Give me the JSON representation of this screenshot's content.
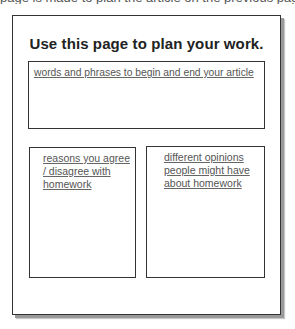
{
  "page": {
    "cutoff_text": "page is made to plan the article on the previous page",
    "title": "Use this page to plan your work."
  },
  "boxes": {
    "top": {
      "label": "words and phrases to begin and end your article"
    },
    "left": {
      "label": "reasons you agree / disagree with homework"
    },
    "right": {
      "label": "different opinions people might have about homework"
    }
  },
  "colors": {
    "border": "#333333",
    "text": "#555555",
    "title": "#222222",
    "shadow": "#9a9a9a",
    "background": "#ffffff"
  }
}
